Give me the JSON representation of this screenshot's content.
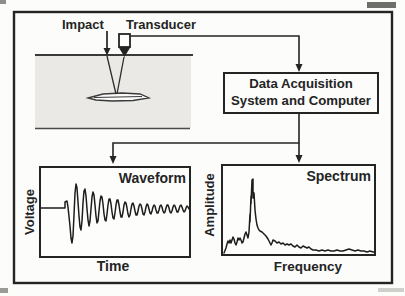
{
  "figure": {
    "impact_label": "Impact",
    "transducer_label": "Transducer",
    "daq_box": {
      "line1": "Data Acquisition",
      "line2": "System and Computer"
    },
    "waveform_panel": {
      "title": "Waveform",
      "ylabel": "Voltage",
      "xlabel": "Time"
    },
    "spectrum_panel": {
      "title": "Spectrum",
      "ylabel": "Amplitude",
      "xlabel": "Frequency"
    },
    "colors": {
      "ink": "#242424",
      "concrete_fill": "#eae9e5",
      "paper": "#fcfcfb",
      "artifact_gray": "#8d8d89"
    }
  },
  "chart_data": [
    {
      "type": "line",
      "title": "Waveform",
      "xlabel": "Time",
      "ylabel": "Voltage",
      "description": "decaying oscillation after impact transient",
      "points_px": [
        [
          41,
          208
        ],
        [
          65,
          208
        ],
        [
          65,
          202
        ],
        [
          67,
          201
        ],
        [
          68,
          207
        ],
        [
          70,
          226
        ],
        [
          71,
          238
        ],
        [
          72,
          243
        ],
        [
          73,
          236
        ],
        [
          74,
          215
        ],
        [
          75,
          193
        ],
        [
          76,
          184
        ],
        [
          77,
          188
        ],
        [
          78,
          202
        ],
        [
          79,
          216
        ],
        [
          80,
          227
        ],
        [
          81,
          230
        ],
        [
          82,
          221
        ],
        [
          83,
          203
        ],
        [
          84,
          191
        ],
        [
          85,
          189
        ],
        [
          86,
          196
        ],
        [
          87,
          209
        ],
        [
          88,
          220
        ],
        [
          89,
          226
        ],
        [
          90,
          221
        ],
        [
          91,
          209
        ],
        [
          92,
          197
        ],
        [
          93,
          192
        ],
        [
          94,
          195
        ],
        [
          95,
          205
        ],
        [
          96,
          216
        ],
        [
          97,
          223
        ],
        [
          98,
          221
        ],
        [
          99,
          211
        ],
        [
          100,
          201
        ],
        [
          101,
          196
        ],
        [
          102,
          197
        ],
        [
          103,
          204
        ],
        [
          104,
          214
        ],
        [
          105,
          220
        ],
        [
          106,
          221
        ],
        [
          107,
          214
        ],
        [
          108,
          205
        ],
        [
          109,
          199
        ],
        [
          110,
          199
        ],
        [
          111,
          204
        ],
        [
          112,
          212
        ],
        [
          113,
          218
        ],
        [
          114,
          219
        ],
        [
          115,
          213
        ],
        [
          116,
          205
        ],
        [
          117,
          200
        ],
        [
          118,
          200
        ],
        [
          119,
          205
        ],
        [
          120,
          212
        ],
        [
          121,
          217
        ],
        [
          122,
          217
        ],
        [
          123,
          212
        ],
        [
          124,
          205
        ],
        [
          125,
          202
        ],
        [
          126,
          203
        ],
        [
          127,
          208
        ],
        [
          128,
          214
        ],
        [
          129,
          217
        ],
        [
          130,
          215
        ],
        [
          131,
          209
        ],
        [
          132,
          204
        ],
        [
          133,
          203
        ],
        [
          134,
          206
        ],
        [
          135,
          211
        ],
        [
          136,
          215
        ],
        [
          137,
          215
        ],
        [
          138,
          211
        ],
        [
          139,
          206
        ],
        [
          140,
          204
        ],
        [
          141,
          205
        ],
        [
          142,
          209
        ],
        [
          143,
          214
        ],
        [
          144,
          215
        ],
        [
          145,
          212
        ],
        [
          146,
          207
        ],
        [
          147,
          204
        ],
        [
          148,
          205
        ],
        [
          149,
          209
        ],
        [
          150,
          213
        ],
        [
          151,
          214
        ],
        [
          152,
          211
        ],
        [
          153,
          207
        ],
        [
          154,
          205
        ],
        [
          155,
          206
        ],
        [
          156,
          210
        ],
        [
          157,
          213
        ],
        [
          158,
          213
        ],
        [
          159,
          210
        ],
        [
          160,
          206
        ],
        [
          161,
          205
        ],
        [
          162,
          207
        ],
        [
          163,
          211
        ],
        [
          164,
          213
        ],
        [
          165,
          212
        ],
        [
          166,
          208
        ],
        [
          167,
          205
        ],
        [
          168,
          205
        ],
        [
          169,
          208
        ],
        [
          170,
          212
        ],
        [
          171,
          213
        ],
        [
          172,
          211
        ],
        [
          173,
          207
        ],
        [
          174,
          205
        ],
        [
          175,
          206
        ],
        [
          176,
          209
        ],
        [
          177,
          212
        ],
        [
          178,
          212
        ],
        [
          179,
          209
        ],
        [
          180,
          206
        ],
        [
          181,
          205
        ],
        [
          182,
          207
        ],
        [
          183,
          210
        ],
        [
          184,
          212
        ],
        [
          185,
          211
        ],
        [
          186,
          208
        ],
        [
          187,
          206
        ],
        [
          188,
          207
        ],
        [
          189,
          209
        ]
      ]
    },
    {
      "type": "line",
      "title": "Spectrum",
      "xlabel": "Frequency",
      "ylabel": "Amplitude",
      "description": "noisy low tail, sharp dominant peak, decaying high-frequency tail",
      "points_px": [
        [
          224,
          253
        ],
        [
          226,
          248
        ],
        [
          227,
          244
        ],
        [
          228,
          241
        ],
        [
          229,
          243
        ],
        [
          230,
          240
        ],
        [
          231,
          243
        ],
        [
          232,
          240
        ],
        [
          233,
          237
        ],
        [
          234,
          239
        ],
        [
          235,
          243
        ],
        [
          236,
          245
        ],
        [
          237,
          242
        ],
        [
          238,
          238
        ],
        [
          239,
          240
        ],
        [
          240,
          238
        ],
        [
          241,
          240
        ],
        [
          242,
          243
        ],
        [
          243,
          242
        ],
        [
          244,
          238
        ],
        [
          245,
          234
        ],
        [
          246,
          232
        ],
        [
          247,
          235
        ],
        [
          248,
          238
        ],
        [
          249,
          232
        ],
        [
          250,
          214
        ],
        [
          250,
          222
        ],
        [
          251,
          196
        ],
        [
          251,
          204
        ],
        [
          252,
          180
        ],
        [
          253,
          179
        ],
        [
          253,
          198
        ],
        [
          254,
          193
        ],
        [
          255,
          210
        ],
        [
          256,
          219
        ],
        [
          257,
          225
        ],
        [
          258,
          228
        ],
        [
          259,
          230
        ],
        [
          260,
          231
        ],
        [
          262,
          232
        ],
        [
          264,
          234
        ],
        [
          266,
          236
        ],
        [
          268,
          239
        ],
        [
          270,
          243
        ],
        [
          271,
          245
        ],
        [
          272,
          243
        ],
        [
          273,
          240
        ],
        [
          275,
          241
        ],
        [
          277,
          243
        ],
        [
          279,
          242
        ],
        [
          281,
          244
        ],
        [
          283,
          243
        ],
        [
          285,
          245
        ],
        [
          287,
          244
        ],
        [
          289,
          245
        ],
        [
          291,
          244
        ],
        [
          293,
          246
        ],
        [
          295,
          247
        ],
        [
          297,
          245
        ],
        [
          299,
          247
        ],
        [
          301,
          248
        ],
        [
          303,
          246
        ],
        [
          305,
          247
        ],
        [
          307,
          248
        ],
        [
          309,
          247
        ],
        [
          311,
          249
        ],
        [
          313,
          250
        ],
        [
          316,
          250
        ],
        [
          319,
          251
        ],
        [
          322,
          250
        ],
        [
          325,
          251
        ],
        [
          328,
          250
        ],
        [
          331,
          251
        ],
        [
          334,
          251
        ],
        [
          337,
          250
        ],
        [
          340,
          251
        ],
        [
          343,
          251
        ],
        [
          346,
          250
        ],
        [
          349,
          249
        ],
        [
          352,
          250
        ],
        [
          355,
          251
        ],
        [
          358,
          250
        ],
        [
          361,
          251
        ],
        [
          364,
          251
        ],
        [
          367,
          252
        ],
        [
          370,
          251
        ],
        [
          373,
          252
        ],
        [
          374,
          252
        ]
      ]
    }
  ]
}
